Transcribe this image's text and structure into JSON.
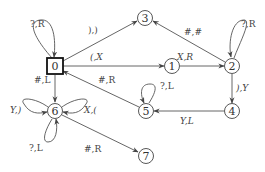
{
  "diagram": {
    "type": "state-machine",
    "start_state": "0",
    "nodes": [
      {
        "id": "0",
        "label": "0",
        "shape": "square",
        "x": 55,
        "y": 66
      },
      {
        "id": "1",
        "label": "1",
        "shape": "circle",
        "x": 172,
        "y": 66
      },
      {
        "id": "2",
        "label": "2",
        "shape": "circle",
        "x": 232,
        "y": 66
      },
      {
        "id": "3",
        "label": "3",
        "shape": "circle",
        "x": 145,
        "y": 18
      },
      {
        "id": "4",
        "label": "4",
        "shape": "circle",
        "x": 232,
        "y": 111
      },
      {
        "id": "5",
        "label": "5",
        "shape": "circle",
        "x": 146,
        "y": 111
      },
      {
        "id": "6",
        "label": "6",
        "shape": "circle",
        "x": 55,
        "y": 111
      },
      {
        "id": "7",
        "label": "7",
        "shape": "circle",
        "x": 146,
        "y": 156
      }
    ],
    "edges": [
      {
        "from": "0",
        "to": "0",
        "label": "?,R"
      },
      {
        "from": "0",
        "to": "3",
        "label": "),)"
      },
      {
        "from": "0",
        "to": "1",
        "label": "(,X"
      },
      {
        "from": "0",
        "to": "6",
        "label": "#,L"
      },
      {
        "from": "1",
        "to": "2",
        "label": "X,R"
      },
      {
        "from": "2",
        "to": "2",
        "label": "?,R"
      },
      {
        "from": "2",
        "to": "3",
        "label": "#,#"
      },
      {
        "from": "2",
        "to": "4",
        "label": "),Y"
      },
      {
        "from": "4",
        "to": "5",
        "label": "Y,L"
      },
      {
        "from": "5",
        "to": "5",
        "label": "?,L"
      },
      {
        "from": "5",
        "to": "0",
        "label": "#,R"
      },
      {
        "from": "6",
        "to": "6",
        "label": "Y,)"
      },
      {
        "from": "6",
        "to": "6",
        "label": "X,("
      },
      {
        "from": "6",
        "to": "6",
        "label": "?,L"
      },
      {
        "from": "6",
        "to": "7",
        "label": "#,R"
      }
    ]
  }
}
